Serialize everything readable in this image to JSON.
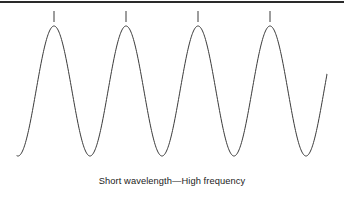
{
  "figure": {
    "caption": "Short wavelength—High frequency",
    "background_color": "#ffffff",
    "border": {
      "name": "top-rule",
      "color": "#2a2a2a",
      "thickness_px": 2,
      "position": "top"
    }
  },
  "chart_data": {
    "type": "line",
    "title": "Short wavelength—High frequency",
    "subtitle": "",
    "xlabel": "",
    "ylabel": "",
    "grid": false,
    "legend": null,
    "axes_visible": false,
    "series": [
      {
        "name": "waveform",
        "description": "High-frequency sine wave with short wavelength",
        "stroke_color": "#3a3a3a",
        "stroke_width": 1,
        "wavelength_px": 72,
        "amplitude_px": 65,
        "cycles": 4.3,
        "baseline_y": 91,
        "peak_y": 26,
        "trough_y": 156,
        "start_point": [
          17,
          160
        ],
        "end_point": [
          327,
          103
        ],
        "peaks_x": [
          54,
          126,
          198,
          270
        ],
        "troughs_x": [
          90,
          162,
          234,
          306
        ]
      }
    ],
    "annotations": [
      {
        "name": "peak-tick-1",
        "x": 54,
        "y_top": 11,
        "y_bottom": 22,
        "label": ""
      },
      {
        "name": "peak-tick-2",
        "x": 126,
        "y_top": 11,
        "y_bottom": 22,
        "label": ""
      },
      {
        "name": "peak-tick-3",
        "x": 198,
        "y_top": 11,
        "y_bottom": 22,
        "label": ""
      },
      {
        "name": "peak-tick-4",
        "x": 270,
        "y_top": 11,
        "y_bottom": 22,
        "label": ""
      }
    ],
    "annotation_color": "#3a3a3a",
    "xlim": [
      0,
      344
    ],
    "ylim": [
      0,
      170
    ]
  }
}
